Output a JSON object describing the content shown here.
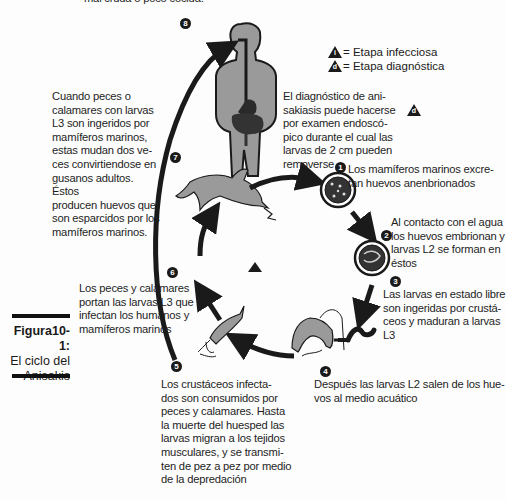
{
  "figure": {
    "top_cut_text": "mal cruda o poco cocida.",
    "caption": {
      "label": "Figura10-1:",
      "line1": "El ciclo del",
      "line2": "Anisakis"
    },
    "legend": {
      "infective": {
        "symbol": "i",
        "label": "= Etapa infecciosa"
      },
      "diagnostic": {
        "symbol": "d",
        "label": "= Etapa diagnóstica"
      }
    },
    "diagnosis_text": "El diagnóstico de ani-\nsakiasis puede hacerse\npor examen endoscó-\npico durante el cual las\nlarvas de 2 cm pueden\nremoverse",
    "diagnosis_marker": "d",
    "steps": [
      {
        "number": "1",
        "text": "Los mamíferos marinos excre-\ntan huevos anenbrionados"
      },
      {
        "number": "2",
        "text": "Al contacto con el agua\nlos huevos embrionan y\nlarvas L2 se forman en\néstos"
      },
      {
        "number": "3",
        "text": "Las larvas en estado libre\nson ingeridas por crustá-\nceos y maduran a larvas L3"
      },
      {
        "number": "4",
        "text": "Después las larvas L2 salen de los hue-\nvos al medio acuático"
      },
      {
        "number": "5",
        "text": "Los  crustáceos infecta-\ndos son consumidos por\npeces y calamares. Hasta\nla muerte del huesped las\nlarvas migran a los tejidos\nmusculares, y se transmi-\nten de pez a pez por medio\nde la depredación"
      },
      {
        "number": "6",
        "text": "Los peces y calamares\nportan las larvas L3 que\ninfectan los humanos y\nmamíferos marinos"
      },
      {
        "number": "7",
        "text": "Cuando peces o\ncalamares con larvas\nL3 son ingeridos por\nmamíferos marinos,\nestas mudan dos ve-\nces convirtiendose en\ngusanos adultos. Éstos\nproducen huevos que\nson esparcidos por los\nmamíferos marinos."
      },
      {
        "number": "8",
        "text": ""
      }
    ],
    "illustrations": [
      "human-body-icon",
      "dolphin-icon",
      "egg-unembryonated-icon",
      "egg-embryonated-icon",
      "larva-icon",
      "crustacean-icon",
      "fish-squid-icon",
      "infective-stage-triangle-icon"
    ],
    "colors": {
      "ink": "#1a1a1a",
      "fill_gray": "#9a9a9a",
      "background": "#fdfdfd"
    }
  }
}
